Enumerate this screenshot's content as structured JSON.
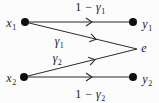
{
  "colors": {
    "background": "#fcfcfc",
    "line": "#2a2a2a",
    "node_fill": "#0f0f0f",
    "text": "#1a1a1a"
  },
  "nodes": {
    "x1": {
      "var": "x",
      "sub": "1"
    },
    "x2": {
      "var": "x",
      "sub": "2"
    },
    "y1": {
      "var": "y",
      "sub": "1"
    },
    "y2": {
      "var": "y",
      "sub": "2"
    },
    "e": {
      "var": "e",
      "sub": ""
    }
  },
  "edges": {
    "x1_y1": {
      "pre": "1 − ",
      "var": "γ",
      "sub": "1"
    },
    "x1_e": {
      "pre": "",
      "var": "γ",
      "sub": "1"
    },
    "x2_e": {
      "pre": "",
      "var": "γ",
      "sub": "2"
    },
    "x2_y2": {
      "pre": "1 − ",
      "var": "γ",
      "sub": "2"
    }
  }
}
